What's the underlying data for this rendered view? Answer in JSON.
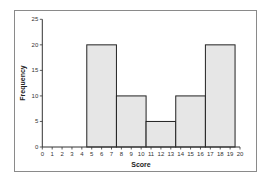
{
  "chart_data": {
    "type": "bar",
    "subtype": "histogram",
    "title": "",
    "xlabel": "Score",
    "ylabel": "Frequency",
    "xlim": [
      0,
      20
    ],
    "ylim": [
      0,
      25
    ],
    "x_ticks": [
      0,
      1,
      2,
      3,
      4,
      5,
      6,
      7,
      8,
      9,
      10,
      11,
      12,
      13,
      14,
      15,
      16,
      17,
      18,
      19,
      20
    ],
    "y_ticks": [
      0,
      5,
      10,
      15,
      20,
      25
    ],
    "bins": [
      {
        "start": 4.5,
        "end": 7.5,
        "label": "5-7",
        "value": 20
      },
      {
        "start": 7.5,
        "end": 10.5,
        "label": "8-10",
        "value": 10
      },
      {
        "start": 10.5,
        "end": 13.5,
        "label": "11-13",
        "value": 5
      },
      {
        "start": 13.5,
        "end": 16.5,
        "label": "14-16",
        "value": 10
      },
      {
        "start": 16.5,
        "end": 19.5,
        "label": "17-19",
        "value": 20
      }
    ],
    "categories": [
      "5-7",
      "8-10",
      "11-13",
      "14-16",
      "17-19"
    ],
    "values": [
      20,
      10,
      5,
      10,
      20
    ],
    "grid": false,
    "legend": null,
    "colors": {
      "bar_fill": "#e6e6e6",
      "bar_edge": "#222222",
      "axis": "#333333",
      "frame": "#8a8a8a"
    }
  }
}
